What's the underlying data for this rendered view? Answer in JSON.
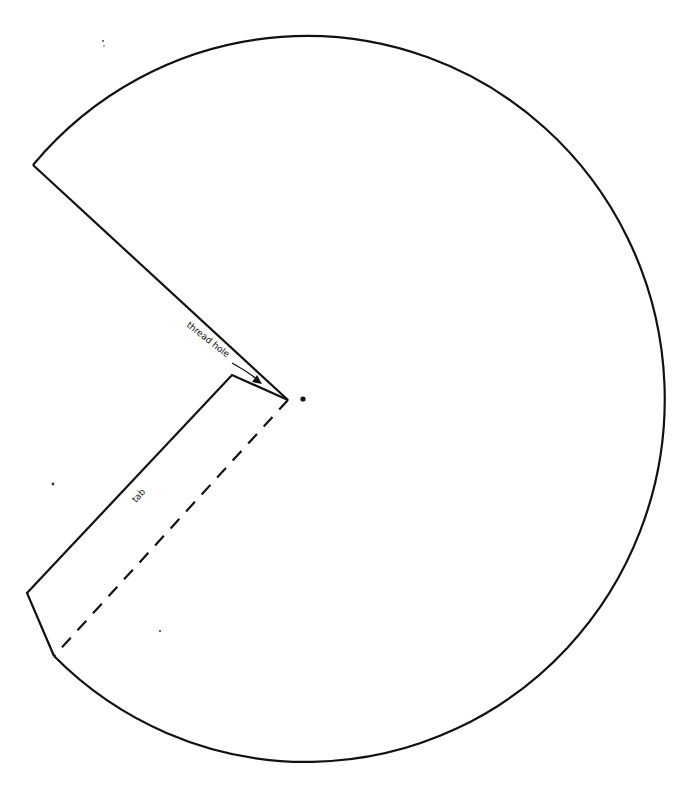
{
  "diagram": {
    "type": "cone-template-cutout",
    "labels": {
      "thread_hole": "thread hole",
      "tab": "tab"
    },
    "colors": {
      "stroke": "#111111",
      "background": "#ffffff"
    }
  }
}
